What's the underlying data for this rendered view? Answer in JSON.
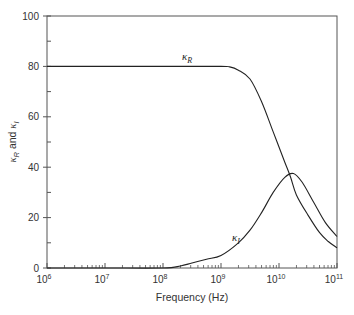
{
  "chart_data": {
    "type": "line",
    "title": "",
    "xlabel": "Frequency (Hz)",
    "ylabel": "κR and κI",
    "ylabel_parts": {
      "k1": "κ",
      "s1": "R",
      "and": " and ",
      "k2": "κ",
      "s2": "I"
    },
    "xscale": "log",
    "xlim": [
      1000000.0,
      100000000000.0
    ],
    "ylim": [
      0,
      100
    ],
    "grid": false,
    "legend": "none (inline curve labels)",
    "x_ticks": [
      {
        "exp": "6",
        "value": 1000000.0
      },
      {
        "exp": "7",
        "value": 10000000.0
      },
      {
        "exp": "8",
        "value": 100000000.0
      },
      {
        "exp": "9",
        "value": 1000000000.0
      },
      {
        "exp": "10",
        "value": 10000000000.0
      },
      {
        "exp": "11",
        "value": 100000000000.0
      }
    ],
    "y_ticks": [
      0,
      20,
      40,
      60,
      80,
      100
    ],
    "y_minor_ticks": [
      10,
      30,
      50,
      70,
      90
    ],
    "series": [
      {
        "name": "κR",
        "label": {
          "base": "κ",
          "sub": "R"
        },
        "log10_x": [
          6,
          7,
          8,
          9,
          9.15,
          9.3,
          9.5,
          9.7,
          9.9,
          10.1,
          10.2,
          10.3,
          10.5,
          10.7,
          10.85,
          11
        ],
        "values": [
          80,
          80,
          80,
          80,
          79.8,
          78.5,
          75,
          66,
          54,
          42,
          36,
          29,
          21,
          14,
          10.5,
          8
        ]
      },
      {
        "name": "κI",
        "label": {
          "base": "κ",
          "sub": "I"
        },
        "log10_x": [
          6,
          7,
          8,
          8.3,
          8.5,
          8.75,
          9,
          9.3,
          9.5,
          9.7,
          9.9,
          10.1,
          10.25,
          10.4,
          10.6,
          10.8,
          11
        ],
        "values": [
          0,
          0,
          0,
          0.8,
          2,
          3.5,
          5,
          10,
          15,
          22,
          30,
          36,
          37.5,
          34,
          26,
          18,
          12.5
        ]
      }
    ]
  },
  "labels": {
    "x_base": "10",
    "y_tick_text": [
      "0",
      "20",
      "40",
      "60",
      "80",
      "100"
    ]
  }
}
